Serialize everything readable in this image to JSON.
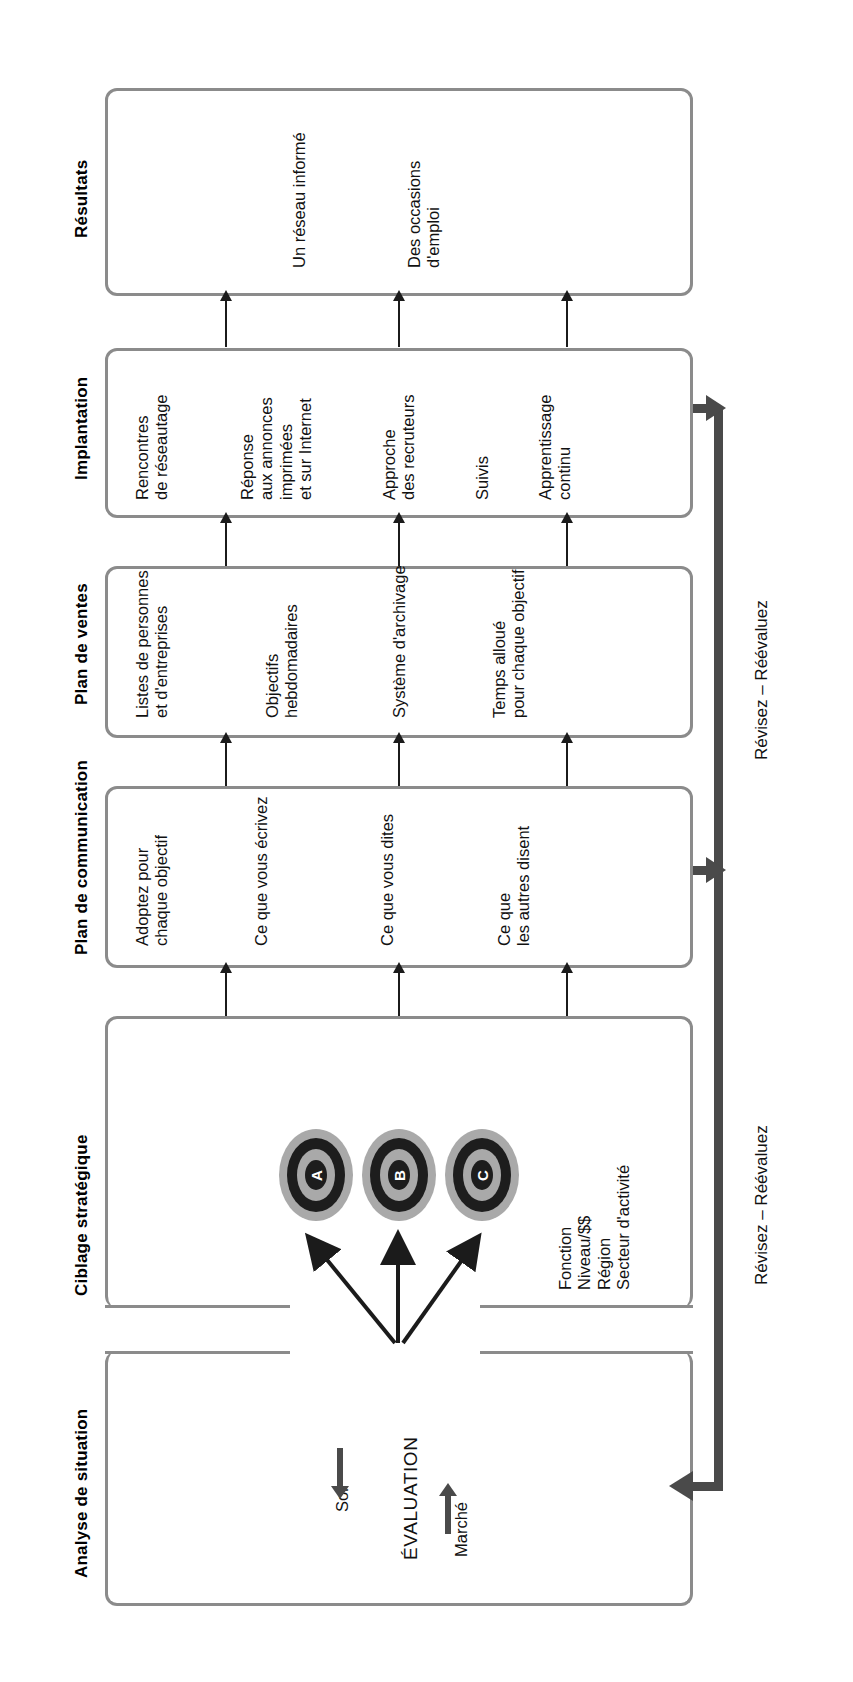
{
  "diagram": {
    "orientation": "rotated-90",
    "stages": [
      {
        "id": "resultats",
        "heading": "Résultats",
        "items": [
          "Un réseau informé",
          "Des occasions\nd'emploi"
        ]
      },
      {
        "id": "implantation",
        "heading": "Implantation",
        "items": [
          "Rencontres\nde réseautage",
          "Réponse\naux annonces\nimprimées\net sur Internet",
          "Approche\ndes recruteurs",
          "Suivis",
          "Apprentissage\ncontinu"
        ]
      },
      {
        "id": "plan-de-ventes",
        "heading": "Plan de ventes",
        "items": [
          "Listes de personnes\net d'entreprises",
          "Objectifs\nhebdomadaires",
          "Système d'archivage",
          "Temps alloué\npour chaque objectif"
        ]
      },
      {
        "id": "plan-de-communication",
        "heading": "Plan de communication",
        "items": [
          "Adoptez pour\nchaque objectif",
          "Ce que vous écrivez",
          "Ce que vous dites",
          "Ce que\nles autres disent"
        ]
      },
      {
        "id": "ciblage-strategique",
        "heading": "Ciblage stratégique",
        "targets": [
          "A",
          "B",
          "C"
        ],
        "criteria": [
          "Fonction",
          "Niveau/$$",
          "Région",
          "Secteur d'activité"
        ]
      },
      {
        "id": "analyse-de-situation",
        "heading": "Analyse de situation",
        "evaluation_label": "ÉVALUATION",
        "inputs": [
          "Soi",
          "Marché"
        ]
      }
    ],
    "feedback_loops": [
      {
        "id": "loop-implantation",
        "label": "Révisez – Réévaluez"
      },
      {
        "id": "loop-communication",
        "label": "Révisez – Réévaluez"
      }
    ]
  }
}
